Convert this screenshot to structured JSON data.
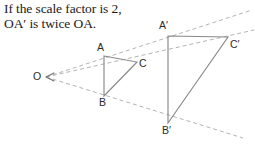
{
  "caption": {
    "line1": "If the scale factor is 2,",
    "line2": "OA′ is twice OA.",
    "full": "If the scale factor is 2,\nOA′ is twice OA."
  },
  "figure": {
    "colors": {
      "solid_stroke": "#8a8a8a",
      "dashed_stroke": "#b4b4b4",
      "label_text": "#2b2b2b",
      "caption_text": "#1a1a1a",
      "background": "#ffffff"
    },
    "center_of_enlargement": {
      "name": "O",
      "label": "O",
      "x": 46,
      "y": 77,
      "label_x": 33,
      "label_y": 71
    },
    "scale_factor": 2,
    "shape_original": {
      "name": "triangle-ABC",
      "vertices": [
        {
          "label": "A",
          "x": 104,
          "y": 56,
          "label_x": 97,
          "label_y": 43
        },
        {
          "label": "C",
          "x": 137,
          "y": 62,
          "label_x": 139,
          "label_y": 60
        },
        {
          "label": "B",
          "x": 104,
          "y": 96,
          "label_x": 99,
          "label_y": 98
        }
      ]
    },
    "shape_image": {
      "name": "triangle-A-prime-B-prime-C-prime",
      "vertices": [
        {
          "label": "A′",
          "x": 168,
          "y": 36,
          "label_x": 160,
          "label_y": 21
        },
        {
          "label": "C′",
          "x": 228,
          "y": 37,
          "label_x": 230,
          "label_y": 41
        },
        {
          "label": "B′",
          "x": 168,
          "y": 123,
          "label_x": 163,
          "label_y": 126
        }
      ]
    },
    "rays": [
      {
        "name": "ray-O-to-A-prime",
        "through": "A",
        "x1": 46,
        "y1": 77,
        "x2": 252,
        "y2": 10
      },
      {
        "name": "ray-O-to-C-prime",
        "through": "C",
        "x1": 46,
        "y1": 77,
        "x2": 254,
        "y2": 30
      },
      {
        "name": "ray-O-to-B-prime",
        "through": "B",
        "x1": 46,
        "y1": 77,
        "x2": 243,
        "y2": 138
      }
    ],
    "arrow": {
      "name": "arrowhead-toward-O",
      "x": 46,
      "y": 77
    }
  }
}
